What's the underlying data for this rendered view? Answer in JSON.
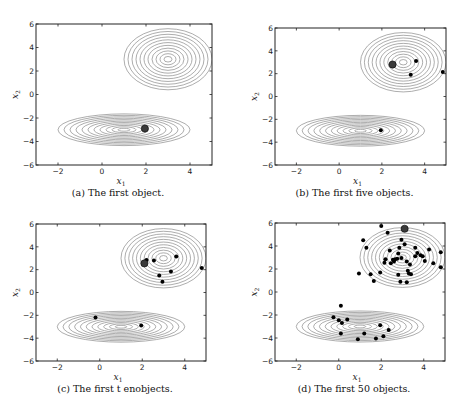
{
  "chart_data": [
    {
      "id": "a",
      "type": "scatter",
      "caption": "(a) The first object.",
      "xlabel": "x1",
      "ylabel": "x2",
      "xlim": [
        -3,
        5
      ],
      "ylim": [
        -6,
        6
      ],
      "xticks": [
        -2,
        0,
        2,
        4
      ],
      "yticks": [
        -6,
        -4,
        -2,
        0,
        2,
        4,
        6
      ],
      "contours": [
        {
          "center": [
            3,
            3
          ],
          "rx": 2.0,
          "ry": 2.6,
          "levels": 11
        },
        {
          "center": [
            1,
            -3
          ],
          "rx": 3.0,
          "ry": 1.35,
          "levels": 11
        }
      ],
      "highlight_point": [
        1.95,
        -2.9
      ],
      "points": []
    },
    {
      "id": "b",
      "type": "scatter",
      "caption": "(b) The first five objects.",
      "xlabel": "x1",
      "ylabel": "x2",
      "xlim": [
        -3,
        5
      ],
      "ylim": [
        -6,
        6
      ],
      "xticks": [
        -2,
        0,
        2,
        4
      ],
      "yticks": [
        -6,
        -4,
        -2,
        0,
        2,
        4,
        6
      ],
      "contours": [
        {
          "center": [
            3,
            3
          ],
          "rx": 2.0,
          "ry": 2.6,
          "levels": 11
        },
        {
          "center": [
            1,
            -3
          ],
          "rx": 3.0,
          "ry": 1.35,
          "levels": 11
        }
      ],
      "highlight_point": [
        2.5,
        2.8
      ],
      "points": [
        [
          3.6,
          3.1
        ],
        [
          3.35,
          1.9
        ],
        [
          4.85,
          2.15
        ],
        [
          1.95,
          -2.95
        ]
      ]
    },
    {
      "id": "c",
      "type": "scatter",
      "caption": "(c) The first t enobjects.",
      "xlabel": "x1",
      "ylabel": "x2",
      "xlim": [
        -3,
        5
      ],
      "ylim": [
        -6,
        6
      ],
      "xticks": [
        -2,
        0,
        2,
        4
      ],
      "yticks": [
        -6,
        -4,
        -2,
        0,
        2,
        4,
        6
      ],
      "contours": [
        {
          "center": [
            3,
            3
          ],
          "rx": 2.0,
          "ry": 2.6,
          "levels": 11
        },
        {
          "center": [
            1,
            -3
          ],
          "rx": 3.0,
          "ry": 1.35,
          "levels": 11
        }
      ],
      "highlight_point": [
        2.1,
        2.55
      ],
      "points": [
        [
          2.2,
          2.85
        ],
        [
          2.55,
          2.8
        ],
        [
          3.6,
          3.15
        ],
        [
          3.35,
          1.85
        ],
        [
          2.8,
          1.5
        ],
        [
          2.95,
          0.95
        ],
        [
          4.8,
          2.15
        ],
        [
          -0.2,
          -2.2
        ],
        [
          1.95,
          -2.9
        ]
      ]
    },
    {
      "id": "d",
      "type": "scatter",
      "caption": "(d) The first 50 objects.",
      "xlabel": "x1",
      "ylabel": "x2",
      "xlim": [
        -3,
        5
      ],
      "ylim": [
        -6,
        6
      ],
      "xticks": [
        -2,
        0,
        2,
        4
      ],
      "yticks": [
        -6,
        -4,
        -2,
        0,
        2,
        4,
        6
      ],
      "contours": [
        {
          "center": [
            3,
            3
          ],
          "rx": 2.0,
          "ry": 2.6,
          "levels": 11
        },
        {
          "center": [
            1,
            -3
          ],
          "rx": 3.0,
          "ry": 1.35,
          "levels": 11
        }
      ],
      "highlight_point": [
        3.1,
        5.5
      ],
      "points": [
        [
          2.0,
          5.75
        ],
        [
          2.3,
          5.15
        ],
        [
          1.15,
          4.5
        ],
        [
          1.3,
          3.85
        ],
        [
          2.95,
          4.55
        ],
        [
          3.1,
          4.15
        ],
        [
          2.4,
          3.6
        ],
        [
          2.85,
          3.85
        ],
        [
          3.6,
          3.85
        ],
        [
          4.25,
          3.7
        ],
        [
          4.8,
          3.45
        ],
        [
          2.8,
          3.35
        ],
        [
          3.7,
          3.4
        ],
        [
          3.85,
          3.2
        ],
        [
          3.6,
          3.1
        ],
        [
          3.95,
          3.1
        ],
        [
          2.2,
          2.85
        ],
        [
          2.55,
          2.8
        ],
        [
          2.65,
          2.85
        ],
        [
          2.75,
          2.9
        ],
        [
          2.95,
          2.95
        ],
        [
          3.2,
          2.65
        ],
        [
          4.05,
          2.7
        ],
        [
          2.15,
          2.55
        ],
        [
          2.45,
          2.5
        ],
        [
          2.6,
          2.65
        ],
        [
          4.45,
          2.5
        ],
        [
          4.8,
          2.15
        ],
        [
          0.95,
          1.6
        ],
        [
          1.5,
          1.55
        ],
        [
          1.95,
          1.7
        ],
        [
          2.8,
          1.5
        ],
        [
          3.3,
          1.6
        ],
        [
          3.4,
          1.55
        ],
        [
          3.25,
          1.85
        ],
        [
          1.65,
          0.95
        ],
        [
          2.9,
          0.9
        ],
        [
          3.2,
          0.85
        ],
        [
          3.35,
          2.4
        ],
        [
          0.1,
          -1.2
        ],
        [
          -0.25,
          -2.2
        ],
        [
          0.0,
          -2.45
        ],
        [
          0.15,
          -2.7
        ],
        [
          0.4,
          -2.4
        ],
        [
          0.1,
          -3.6
        ],
        [
          1.2,
          -3.6
        ],
        [
          0.9,
          -4.1
        ],
        [
          1.95,
          -2.9
        ],
        [
          2.35,
          -3.3
        ],
        [
          2.1,
          -3.85
        ],
        [
          1.75,
          -4.05
        ]
      ]
    }
  ]
}
